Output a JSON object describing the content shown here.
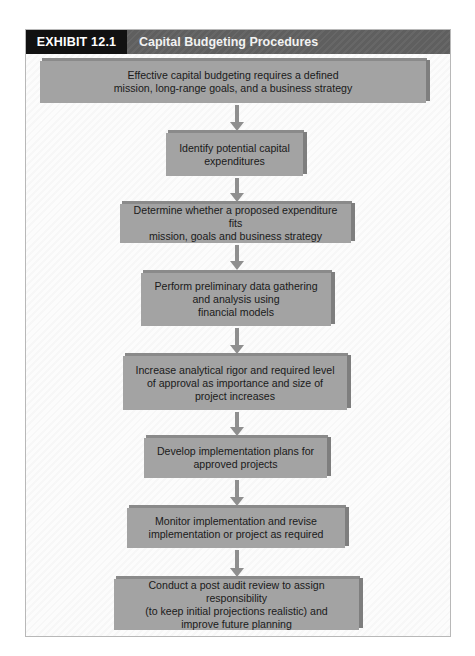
{
  "exhibit": {
    "label": "EXHIBIT 12.1",
    "title": "Capital Budgeting Procedures"
  },
  "colors": {
    "header_label_bg": "#111111",
    "header_bg": "#5f5f5f",
    "box_fill": "#a3a3a3",
    "box_side": "#7e7e7e",
    "arrow": "#8f8f8f"
  },
  "steps": [
    {
      "text": "Effective capital budgeting requires a defined\nmission, long-range goals, and a business strategy"
    },
    {
      "text": "Identify potential capital\nexpenditures"
    },
    {
      "text": "Determine whether a proposed expenditure fits\nmission, goals and business strategy"
    },
    {
      "text": "Perform preliminary data gathering\nand analysis using\nfinancial models"
    },
    {
      "text": "Increase analytical rigor and required level\nof approval as importance and size of\nproject increases"
    },
    {
      "text": "Develop implementation plans for\napproved projects"
    },
    {
      "text": "Monitor implementation and revise\nimplementation or project as required"
    },
    {
      "text": "Conduct a post audit review to assign responsibility\n(to keep initial projections realistic) and\nimprove future planning"
    }
  ]
}
